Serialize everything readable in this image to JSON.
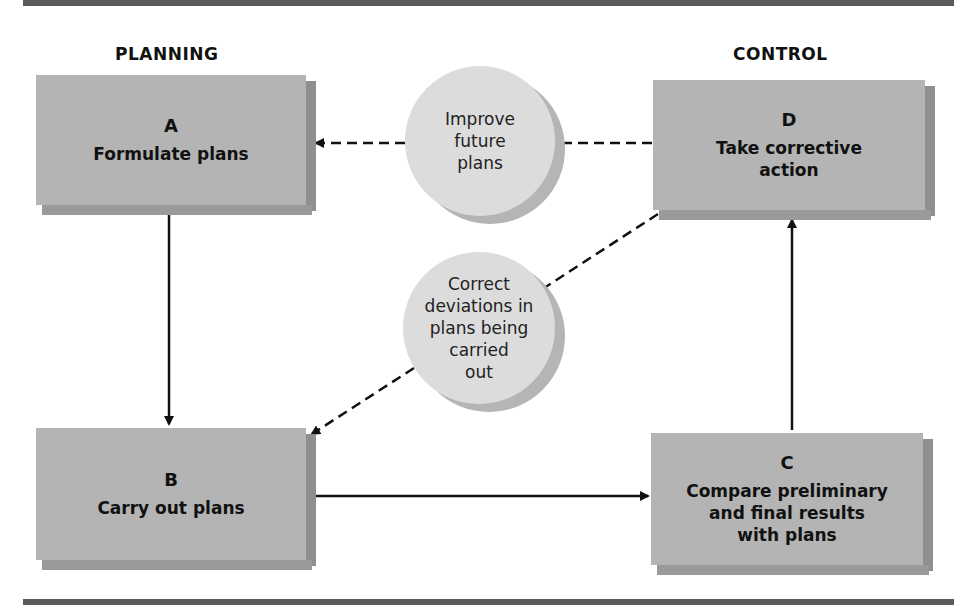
{
  "headings": {
    "planning": "PLANNING",
    "control": "CONTROL"
  },
  "boxes": {
    "a": {
      "letter": "A",
      "label": "Formulate plans"
    },
    "b": {
      "letter": "B",
      "label": "Carry out plans"
    },
    "c": {
      "letter": "C",
      "label": "Compare preliminary\nand final results\nwith plans"
    },
    "d": {
      "letter": "D",
      "label": "Take corrective\naction"
    }
  },
  "circles": {
    "improve": "Improve\nfuture\nplans",
    "correct": "Correct\ndeviations in\nplans being\ncarried\nout"
  },
  "colors": {
    "box_fill": "#b4b4b4",
    "circle_fill": "#dcdcdc",
    "rule": "#5a5a5a",
    "arrow": "#111111"
  }
}
